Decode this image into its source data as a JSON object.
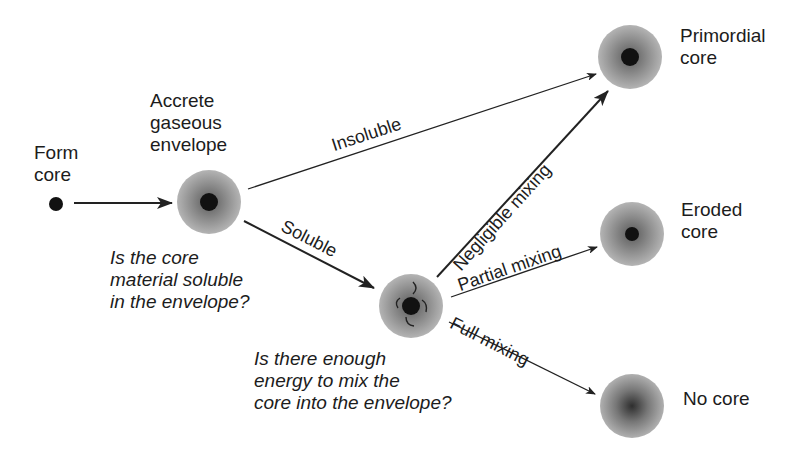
{
  "nodes": {
    "form_core": {
      "line1": "Form",
      "line2": "core"
    },
    "accrete": {
      "line1": "Accrete",
      "line2": "gaseous",
      "line3": "envelope"
    },
    "primordial": {
      "line1": "Primordial",
      "line2": "core"
    },
    "eroded": {
      "line1": "Eroded",
      "line2": "core"
    },
    "no_core": {
      "line1": "No core"
    }
  },
  "edges": {
    "insoluble": "Insoluble",
    "soluble": "Soluble",
    "negligible": "Negligible mixing",
    "partial": "Partial mixing",
    "full": "Full mixing"
  },
  "questions": {
    "q1": {
      "line1": "Is the core",
      "line2": "material soluble",
      "line3": "in the envelope?"
    },
    "q2": {
      "line1": "Is there enough",
      "line2": "energy to mix the",
      "line3": "core into the envelope?"
    }
  },
  "colors": {
    "sphere": "#9a9a9a",
    "core": "#111111",
    "arrow": "#222222"
  }
}
